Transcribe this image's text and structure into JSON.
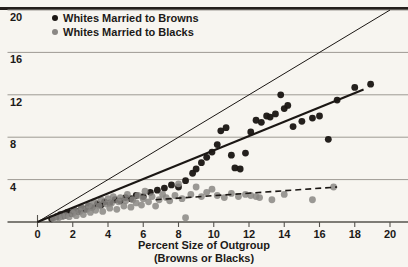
{
  "chart_data": {
    "type": "scatter",
    "title": "",
    "xlabel": "Percent Size of Outgroup",
    "xlabel_sub": "(Browns or Blacks)",
    "ylabel": "",
    "xlim": [
      0,
      20
    ],
    "ylim": [
      0,
      20
    ],
    "xticks": [
      0,
      2,
      4,
      6,
      8,
      10,
      12,
      14,
      16,
      18,
      20
    ],
    "yticks": [
      0,
      4,
      8,
      12,
      16,
      20
    ],
    "grid": "horizontal",
    "legend_position": "top-left",
    "colors": {
      "browns_series": "#1b1714",
      "blacks_series": "#8a8784",
      "gridline": "#9d9a93",
      "axis": "#56534e",
      "background": "#f7f5f0",
      "top_rule": "#241f1c"
    },
    "series": [
      {
        "name": "Whites Married to Browns",
        "marker": "filled-circle-dark",
        "points": [
          [
            0.8,
            0.3
          ],
          [
            1.1,
            0.5
          ],
          [
            1.3,
            0.7
          ],
          [
            1.5,
            0.6
          ],
          [
            1.7,
            0.9
          ],
          [
            1.9,
            0.8
          ],
          [
            2.1,
            1.1
          ],
          [
            2.3,
            1.0
          ],
          [
            2.5,
            1.3
          ],
          [
            2.7,
            1.2
          ],
          [
            2.9,
            1.5
          ],
          [
            3.1,
            1.4
          ],
          [
            3.4,
            1.7
          ],
          [
            3.6,
            1.6
          ],
          [
            3.8,
            1.9
          ],
          [
            4.1,
            1.8
          ],
          [
            4.4,
            2.1
          ],
          [
            4.7,
            2.0
          ],
          [
            5.0,
            2.3
          ],
          [
            5.3,
            2.2
          ],
          [
            5.6,
            2.5
          ],
          [
            6.0,
            2.4
          ],
          [
            6.4,
            2.8
          ],
          [
            6.8,
            3.0
          ],
          [
            7.2,
            3.2
          ],
          [
            7.6,
            3.5
          ],
          [
            8.0,
            3.3
          ],
          [
            8.4,
            3.9
          ],
          [
            8.8,
            4.6
          ],
          [
            9.0,
            5.0
          ],
          [
            9.3,
            5.6
          ],
          [
            9.6,
            6.1
          ],
          [
            9.9,
            6.6
          ],
          [
            10.2,
            7.3
          ],
          [
            10.4,
            8.6
          ],
          [
            10.7,
            8.9
          ],
          [
            11.0,
            6.3
          ],
          [
            11.2,
            5.1
          ],
          [
            11.5,
            5.0
          ],
          [
            11.8,
            6.5
          ],
          [
            12.1,
            8.5
          ],
          [
            12.4,
            9.6
          ],
          [
            12.7,
            9.4
          ],
          [
            13.0,
            10.0
          ],
          [
            13.2,
            9.9
          ],
          [
            13.5,
            10.2
          ],
          [
            13.8,
            12.0
          ],
          [
            14.0,
            10.7
          ],
          [
            14.2,
            11.0
          ],
          [
            14.5,
            9.0
          ],
          [
            15.0,
            9.5
          ],
          [
            15.6,
            9.8
          ],
          [
            16.0,
            10.0
          ],
          [
            16.5,
            7.8
          ],
          [
            17.0,
            11.5
          ],
          [
            18.0,
            12.7
          ],
          [
            18.9,
            13.0
          ]
        ]
      },
      {
        "name": "Whites Married to Blacks",
        "marker": "filled-circle-gray",
        "points": [
          [
            0.9,
            0.3
          ],
          [
            1.2,
            0.4
          ],
          [
            1.4,
            0.5
          ],
          [
            1.6,
            0.6
          ],
          [
            1.8,
            0.5
          ],
          [
            2.0,
            0.8
          ],
          [
            2.1,
            1.1
          ],
          [
            2.2,
            0.6
          ],
          [
            2.4,
            1.0
          ],
          [
            2.5,
            1.4
          ],
          [
            2.6,
            0.7
          ],
          [
            2.8,
            1.2
          ],
          [
            2.9,
            1.6
          ],
          [
            3.0,
            0.9
          ],
          [
            3.1,
            1.4
          ],
          [
            3.2,
            1.9
          ],
          [
            3.3,
            1.1
          ],
          [
            3.5,
            1.5
          ],
          [
            3.6,
            2.1
          ],
          [
            3.7,
            1.0
          ],
          [
            3.9,
            1.7
          ],
          [
            4.0,
            2.2
          ],
          [
            4.1,
            1.3
          ],
          [
            4.2,
            1.8
          ],
          [
            4.3,
            2.4
          ],
          [
            4.5,
            1.2
          ],
          [
            4.6,
            1.9
          ],
          [
            4.7,
            2.3
          ],
          [
            4.9,
            1.5
          ],
          [
            5.0,
            2.0
          ],
          [
            5.1,
            2.6
          ],
          [
            5.3,
            1.4
          ],
          [
            5.4,
            2.1
          ],
          [
            5.6,
            1.8
          ],
          [
            5.7,
            2.5
          ],
          [
            5.9,
            1.6
          ],
          [
            6.0,
            2.2
          ],
          [
            6.1,
            2.9
          ],
          [
            6.3,
            1.9
          ],
          [
            6.5,
            2.4
          ],
          [
            6.7,
            1.5
          ],
          [
            6.9,
            2.1
          ],
          [
            7.1,
            2.6
          ],
          [
            7.3,
            2.3
          ],
          [
            7.5,
            2.0
          ],
          [
            7.8,
            2.5
          ],
          [
            8.0,
            3.6
          ],
          [
            8.2,
            2.2
          ],
          [
            8.4,
            0.4
          ],
          [
            8.7,
            2.6
          ],
          [
            9.0,
            3.3
          ],
          [
            9.3,
            2.4
          ],
          [
            9.6,
            2.8
          ],
          [
            9.9,
            3.1
          ],
          [
            10.2,
            2.5
          ],
          [
            10.6,
            2.3
          ],
          [
            11.0,
            2.7
          ],
          [
            11.4,
            2.4
          ],
          [
            11.8,
            2.6
          ],
          [
            12.1,
            2.5
          ],
          [
            12.4,
            2.4
          ],
          [
            12.6,
            2.3
          ],
          [
            13.3,
            2.1
          ],
          [
            14.0,
            2.6
          ],
          [
            15.6,
            2.1
          ],
          [
            16.8,
            3.3
          ]
        ]
      }
    ],
    "reference_line": {
      "name": "equality-line",
      "style": "thin-solid",
      "from": [
        0,
        0
      ],
      "to": [
        20,
        20
      ]
    },
    "trend_lines": [
      {
        "name": "browns-trend",
        "style": "thick-solid",
        "from": [
          0,
          0
        ],
        "to": [
          18.5,
          12.5
        ]
      },
      {
        "name": "blacks-trend",
        "style": "dashed",
        "from": [
          6.7,
          2.1
        ],
        "to": [
          17.0,
          3.3
        ]
      }
    ]
  },
  "legend": {
    "items": [
      {
        "label": "Whites Married to Browns",
        "color": "#1b1714"
      },
      {
        "label": "Whites Married to Blacks",
        "color": "#8a8784"
      }
    ]
  },
  "axes": {
    "y_labels": [
      "20",
      "16",
      "12",
      "8",
      "4"
    ],
    "x_labels": [
      "0",
      "2",
      "4",
      "6",
      "8",
      "10",
      "12",
      "14",
      "16",
      "18",
      "20"
    ],
    "x_title": "Percent Size of Outgroup",
    "x_title_sub": "(Browns or Blacks)"
  }
}
